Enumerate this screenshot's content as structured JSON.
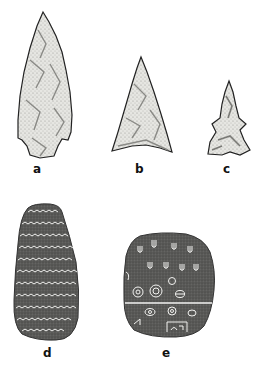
{
  "figure": {
    "artifacts": [
      {
        "id": "a",
        "label": "a",
        "description": "large stemmed chipped-stone projectile point"
      },
      {
        "id": "b",
        "label": "b",
        "description": "triangular chipped-stone point"
      },
      {
        "id": "c",
        "label": "c",
        "description": "small corner-notched point"
      },
      {
        "id": "d",
        "label": "d",
        "description": "oblong stone with incised zigzag bands"
      },
      {
        "id": "e",
        "label": "e",
        "description": "rounded stone with incised symbols and circles"
      }
    ],
    "colors": {
      "background": "#ffffff",
      "flint_fill": "#e6e6e2",
      "flint_shade": "#8a8a86",
      "outline": "#222222",
      "stone_fill": "#5a5a58",
      "incision": "#f2f2f0",
      "label": "#111111"
    }
  }
}
